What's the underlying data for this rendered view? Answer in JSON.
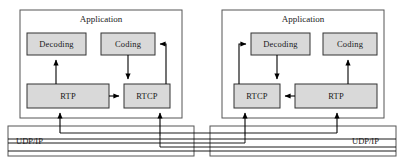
{
  "diagram": {
    "colors": {
      "box_fill": "#d9d9d9",
      "box_stroke": "#333333",
      "container_stroke": "#555555",
      "arrow": "#000000",
      "background": "#ffffff"
    },
    "left_stack": {
      "application_label": "Application",
      "decoding_label": "Decoding",
      "coding_label": "Coding",
      "rtp_label": "RTP",
      "rtcp_label": "RTCP",
      "udpip_label": "UDP/IP"
    },
    "right_stack": {
      "application_label": "Application",
      "decoding_label": "Decoding",
      "coding_label": "Coding",
      "rtcp_label": "RTCP",
      "rtp_label": "RTP",
      "udpip_label": "UDP/IP"
    }
  }
}
